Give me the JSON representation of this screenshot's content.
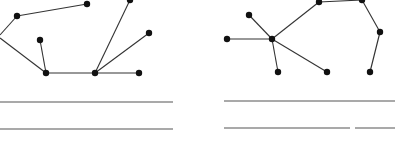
{
  "graphs": [
    {
      "name": "left-graph",
      "nodes": [
        [
          17,
          16
        ],
        [
          87,
          4
        ],
        [
          40,
          40
        ],
        [
          46,
          73
        ],
        [
          95,
          73
        ],
        [
          130,
          0
        ],
        [
          149,
          33
        ],
        [
          139,
          73
        ]
      ],
      "edges": [
        [
          [
            0,
            35
          ],
          [
            17,
            16
          ]
        ],
        [
          [
            17,
            16
          ],
          [
            87,
            4
          ]
        ],
        [
          [
            0,
            38
          ],
          [
            46,
            73
          ]
        ],
        [
          [
            40,
            40
          ],
          [
            46,
            73
          ]
        ],
        [
          [
            46,
            73
          ],
          [
            95,
            73
          ]
        ],
        [
          [
            95,
            73
          ],
          [
            130,
            0
          ]
        ],
        [
          [
            95,
            73
          ],
          [
            149,
            33
          ]
        ],
        [
          [
            95,
            73
          ],
          [
            139,
            73
          ]
        ]
      ]
    },
    {
      "name": "right-graph",
      "nodes": [
        [
          227,
          39
        ],
        [
          249,
          15
        ],
        [
          272,
          39
        ],
        [
          278,
          72
        ],
        [
          327,
          72
        ],
        [
          319,
          2
        ],
        [
          362,
          0
        ],
        [
          380,
          32
        ],
        [
          370,
          72
        ]
      ],
      "edges": [
        [
          [
            227,
            39
          ],
          [
            272,
            39
          ]
        ],
        [
          [
            249,
            15
          ],
          [
            272,
            39
          ]
        ],
        [
          [
            272,
            39
          ],
          [
            278,
            72
          ]
        ],
        [
          [
            272,
            39
          ],
          [
            327,
            72
          ]
        ],
        [
          [
            272,
            39
          ],
          [
            319,
            2
          ]
        ],
        [
          [
            319,
            2
          ],
          [
            362,
            0
          ]
        ],
        [
          [
            362,
            0
          ],
          [
            380,
            32
          ]
        ],
        [
          [
            380,
            32
          ],
          [
            370,
            72
          ]
        ]
      ]
    }
  ],
  "lines": [
    [
      0,
      102,
      173,
      102
    ],
    [
      0,
      129,
      173,
      129
    ],
    [
      224,
      101,
      395,
      101
    ],
    [
      224,
      128,
      350,
      128
    ],
    [
      355,
      128,
      395,
      128
    ]
  ],
  "colors": {
    "stroke": "#333333",
    "node": "#111111"
  }
}
